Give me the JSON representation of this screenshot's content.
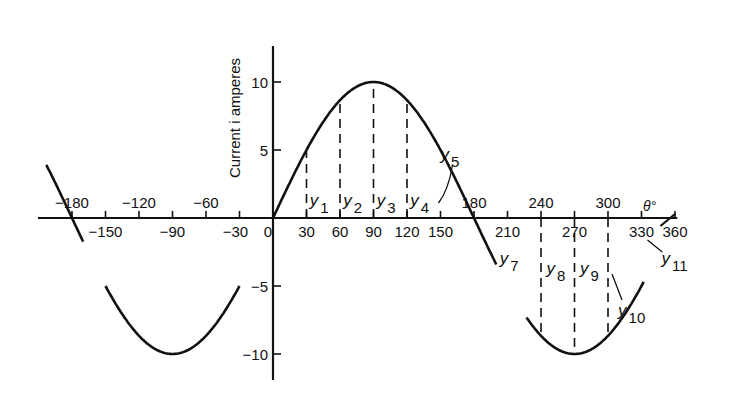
{
  "chart_data": {
    "type": "line",
    "title": "",
    "xlabel": "θ°",
    "ylabel": "Current i amperes",
    "xlim": [
      -195,
      362
    ],
    "ylim": [
      -11,
      12.5
    ],
    "grid": false,
    "legend": null,
    "x_ticks_above": [
      -180,
      -120,
      -60,
      180,
      240,
      300
    ],
    "x_ticks_below": [
      -150,
      -90,
      -30,
      0,
      30,
      60,
      90,
      120,
      150,
      210,
      270,
      330,
      360
    ],
    "y_ticks": [
      10,
      5,
      -5,
      -10
    ],
    "series": [
      {
        "name": "i = 10 sin θ (positive half-cycle, shifted)",
        "description": "Sine-like current wave, amplitude 10 A, peak at 90°, trough at 270° and -90°",
        "x": [
          -195,
          -180,
          -150,
          -120,
          -90,
          -60,
          -30,
          0,
          30,
          60,
          90,
          120,
          150,
          180,
          210,
          240,
          270,
          300,
          330,
          360
        ],
        "values": [
          2.5,
          0,
          -5,
          -8.7,
          -10,
          -8.7,
          -5,
          0,
          5,
          8.7,
          10,
          8.7,
          5,
          0,
          -5,
          -8.7,
          -10,
          -8.7,
          -5,
          0
        ]
      }
    ],
    "ordinates": [
      {
        "label": "y1",
        "x": 15
      },
      {
        "label": "y2",
        "x": 45
      },
      {
        "label": "y3",
        "x": 75
      },
      {
        "label": "y4",
        "x": 105
      },
      {
        "label": "y5",
        "x": 135
      },
      {
        "label": "y7",
        "x": 195
      },
      {
        "label": "y8",
        "x": 225
      },
      {
        "label": "y9",
        "x": 255
      },
      {
        "label": "y10",
        "x": 285
      },
      {
        "label": "y11",
        "x": 345
      }
    ],
    "dashed_lines_at": [
      30,
      60,
      90,
      120,
      240,
      270,
      300
    ]
  },
  "labels": {
    "ylabel": "Current i amperes",
    "xlabel": "θ°",
    "ordinate_prefix": "y"
  }
}
